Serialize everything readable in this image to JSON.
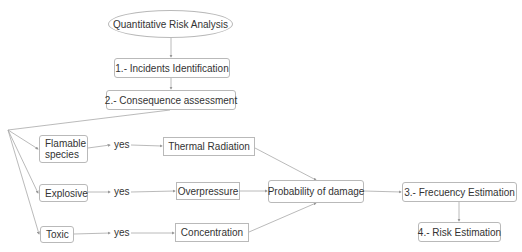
{
  "diagram": {
    "start": "Quantitative Risk Analysis",
    "steps": {
      "incidents": "1.- Incidents Identification",
      "consequence": "2.- Consequence assessment",
      "frequency": "3.- Frecuency Estimation",
      "risk": "4.- Risk Estimation"
    },
    "species": {
      "flamable": "Flamable species",
      "explosive": "Explosive",
      "toxic": "Toxic"
    },
    "edge_labels": {
      "yes_1": "yes",
      "yes_2": "yes",
      "yes_3": "yes"
    },
    "effects": {
      "thermal": "Thermal Radiation",
      "overpressure": "Overpressure",
      "concentration": "Concentration"
    },
    "probability": "Probability of damage",
    "colors": {
      "line": "#a8a8a8",
      "border": "#b9b9b9",
      "text": "#333333"
    }
  }
}
